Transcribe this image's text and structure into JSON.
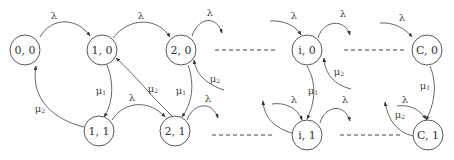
{
  "diagram": {
    "type": "state-transition-diagram",
    "nodes": [
      {
        "id": "n00",
        "label": "0, 0"
      },
      {
        "id": "n10",
        "label": "1, 0"
      },
      {
        "id": "n20",
        "label": "2, 0"
      },
      {
        "id": "n11",
        "label": "1, 1"
      },
      {
        "id": "n21",
        "label": "2, 1"
      },
      {
        "id": "ni0",
        "label": "i, 0"
      },
      {
        "id": "ni1",
        "label": "i, 1"
      },
      {
        "id": "nC0",
        "label": "C, 0"
      },
      {
        "id": "nC1",
        "label": "C, 1"
      }
    ],
    "labels": {
      "lambda": "λ",
      "mu": "μ",
      "sub1": "1",
      "sub2": "2"
    },
    "edges": [
      {
        "from": "0, 0",
        "to": "1, 0",
        "label": "λ"
      },
      {
        "from": "1, 0",
        "to": "2, 0",
        "label": "λ"
      },
      {
        "from": "2, 0",
        "to": "…",
        "label": "λ"
      },
      {
        "from": "1, 0",
        "to": "1, 1",
        "label": "μ1"
      },
      {
        "from": "1, 1",
        "to": "0, 0",
        "label": "μ2"
      },
      {
        "from": "1, 1",
        "to": "2, 1",
        "label": "λ"
      },
      {
        "from": "2, 1",
        "to": "1, 0",
        "label": "μ2"
      },
      {
        "from": "2, 0",
        "to": "2, 1",
        "label": "μ1"
      },
      {
        "from": "…",
        "to": "2, 0",
        "label": "μ2"
      },
      {
        "from": "2, 1",
        "to": "…",
        "label": "λ"
      },
      {
        "from": "…",
        "to": "i, 0",
        "label": "λ"
      },
      {
        "from": "i, 0",
        "to": "…",
        "label": "λ"
      },
      {
        "from": "i, 0",
        "to": "i, 1",
        "label": "μ1"
      },
      {
        "from": "…",
        "to": "i, 0",
        "label": "μ2"
      },
      {
        "from": "…",
        "to": "i, 1",
        "label": "λ"
      },
      {
        "from": "i, 1",
        "to": "…",
        "label": "λ"
      },
      {
        "from": "i, 1",
        "to": "…",
        "label": "μ2"
      },
      {
        "from": "…",
        "to": "C, 0",
        "label": "λ"
      },
      {
        "from": "C, 0",
        "to": "C, 1",
        "label": "μ1"
      },
      {
        "from": "…",
        "to": "C, 1",
        "label": "λ"
      },
      {
        "from": "C, 1",
        "to": "…",
        "label": "μ2"
      }
    ]
  }
}
